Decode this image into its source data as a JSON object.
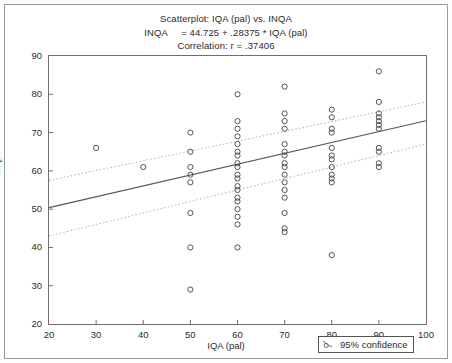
{
  "figure": {
    "width": 452,
    "height": 363,
    "background": "#ffffff",
    "border_color": "#9a9a9a"
  },
  "title": {
    "line1": "Scatterplot: IQA (pal) vs. INQA",
    "line2": "INQA     = 44.725 + .28375 * IQA (pal)",
    "line3": "Correlation: r = .37406"
  },
  "legend": {
    "label": "95% confidence",
    "symbol": "dashed-line-with-circle-marker"
  },
  "colors": {
    "point_stroke": "#4a4a4a",
    "regression_line": "#555555",
    "confidence_band": "#b9b9b9",
    "axis": "#6e6e6e",
    "text": "#2b2b2b"
  },
  "chart_data": {
    "type": "scatter",
    "title": "Scatterplot: IQA (pal) vs. INQA",
    "subtitle": "INQA     = 44.725 + .28375 * IQA (pal)",
    "annotation": "Correlation: r = .37406",
    "xlabel": "IQA (pal)",
    "ylabel": "INQA",
    "xlim": [
      20,
      100
    ],
    "ylim": [
      20,
      90
    ],
    "xticks": [
      20,
      30,
      40,
      50,
      60,
      70,
      80,
      90,
      100
    ],
    "yticks": [
      20,
      30,
      40,
      50,
      60,
      70,
      80,
      90
    ],
    "grid": false,
    "legend_position": "below-axis-right",
    "marker": "open-circle",
    "regression": {
      "intercept": 44.725,
      "slope": 0.28375,
      "r": 0.37406,
      "equation": "INQA = 44.725 + .28375 * IQA (pal)"
    },
    "confidence": {
      "level": 0.95,
      "label": "95% confidence",
      "upper_at_xmin": 57.5,
      "upper_at_xmax": 78.0,
      "lower_at_xmin": 43.0,
      "lower_at_xmax": 67.0
    },
    "points": [
      {
        "x": 30,
        "y": 66
      },
      {
        "x": 40,
        "y": 61
      },
      {
        "x": 50,
        "y": 70
      },
      {
        "x": 50,
        "y": 65
      },
      {
        "x": 50,
        "y": 61
      },
      {
        "x": 50,
        "y": 59
      },
      {
        "x": 50,
        "y": 57
      },
      {
        "x": 50,
        "y": 49
      },
      {
        "x": 50,
        "y": 40
      },
      {
        "x": 50,
        "y": 29
      },
      {
        "x": 60,
        "y": 80
      },
      {
        "x": 60,
        "y": 73
      },
      {
        "x": 60,
        "y": 71
      },
      {
        "x": 60,
        "y": 69
      },
      {
        "x": 60,
        "y": 67
      },
      {
        "x": 60,
        "y": 65
      },
      {
        "x": 60,
        "y": 64
      },
      {
        "x": 60,
        "y": 62
      },
      {
        "x": 60,
        "y": 61
      },
      {
        "x": 60,
        "y": 59
      },
      {
        "x": 60,
        "y": 58
      },
      {
        "x": 60,
        "y": 56
      },
      {
        "x": 60,
        "y": 55
      },
      {
        "x": 60,
        "y": 53
      },
      {
        "x": 60,
        "y": 52
      },
      {
        "x": 60,
        "y": 50
      },
      {
        "x": 60,
        "y": 48
      },
      {
        "x": 60,
        "y": 46
      },
      {
        "x": 60,
        "y": 40
      },
      {
        "x": 70,
        "y": 82
      },
      {
        "x": 70,
        "y": 75
      },
      {
        "x": 70,
        "y": 73
      },
      {
        "x": 70,
        "y": 71
      },
      {
        "x": 70,
        "y": 67
      },
      {
        "x": 70,
        "y": 65
      },
      {
        "x": 70,
        "y": 64
      },
      {
        "x": 70,
        "y": 62
      },
      {
        "x": 70,
        "y": 61
      },
      {
        "x": 70,
        "y": 59
      },
      {
        "x": 70,
        "y": 57
      },
      {
        "x": 70,
        "y": 55
      },
      {
        "x": 70,
        "y": 53
      },
      {
        "x": 70,
        "y": 49
      },
      {
        "x": 70,
        "y": 45
      },
      {
        "x": 70,
        "y": 44
      },
      {
        "x": 80,
        "y": 76
      },
      {
        "x": 80,
        "y": 74
      },
      {
        "x": 80,
        "y": 71
      },
      {
        "x": 80,
        "y": 70
      },
      {
        "x": 80,
        "y": 66
      },
      {
        "x": 80,
        "y": 64
      },
      {
        "x": 80,
        "y": 63
      },
      {
        "x": 80,
        "y": 61
      },
      {
        "x": 80,
        "y": 59
      },
      {
        "x": 80,
        "y": 58
      },
      {
        "x": 80,
        "y": 57
      },
      {
        "x": 80,
        "y": 38
      },
      {
        "x": 90,
        "y": 86
      },
      {
        "x": 90,
        "y": 78
      },
      {
        "x": 90,
        "y": 75
      },
      {
        "x": 90,
        "y": 74
      },
      {
        "x": 90,
        "y": 73
      },
      {
        "x": 90,
        "y": 72
      },
      {
        "x": 90,
        "y": 71
      },
      {
        "x": 90,
        "y": 66
      },
      {
        "x": 90,
        "y": 65
      },
      {
        "x": 90,
        "y": 62
      },
      {
        "x": 90,
        "y": 61
      }
    ]
  }
}
